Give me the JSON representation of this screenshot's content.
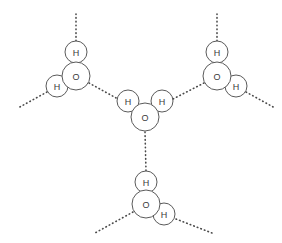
{
  "figure": {
    "background_color": "#ffffff",
    "stroke_color": "#5a5a5a",
    "label_color": "#3a3a3a",
    "bond_color": "#4a4a4a",
    "width": 282,
    "height": 243
  },
  "labels": {
    "oxygen": "O",
    "hydrogen": "H"
  },
  "molecules": [
    {
      "id": "molecule-top-left",
      "name": "water-molecule-top-left",
      "atoms": [
        {
          "id": "tl-O",
          "element": "O",
          "label": "O",
          "cx": 76,
          "cy": 76,
          "r": 14
        },
        {
          "id": "tl-H1",
          "element": "H",
          "label": "H",
          "cx": 76,
          "cy": 52,
          "r": 11
        },
        {
          "id": "tl-H2",
          "element": "H",
          "label": "H",
          "cx": 57,
          "cy": 86,
          "r": 11
        }
      ]
    },
    {
      "id": "molecule-top-right",
      "name": "water-molecule-top-right",
      "atoms": [
        {
          "id": "tr-O",
          "element": "O",
          "label": "O",
          "cx": 217,
          "cy": 76,
          "r": 14
        },
        {
          "id": "tr-H1",
          "element": "H",
          "label": "H",
          "cx": 217,
          "cy": 52,
          "r": 11
        },
        {
          "id": "tr-H2",
          "element": "H",
          "label": "H",
          "cx": 236,
          "cy": 86,
          "r": 11
        }
      ]
    },
    {
      "id": "molecule-center",
      "name": "water-molecule-center",
      "atoms": [
        {
          "id": "c-O",
          "element": "O",
          "label": "O",
          "cx": 145,
          "cy": 117,
          "r": 14
        },
        {
          "id": "c-H1",
          "element": "H",
          "label": "H",
          "cx": 128,
          "cy": 101,
          "r": 11
        },
        {
          "id": "c-H2",
          "element": "H",
          "label": "H",
          "cx": 162,
          "cy": 101,
          "r": 11
        }
      ]
    },
    {
      "id": "molecule-bottom",
      "name": "water-molecule-bottom",
      "atoms": [
        {
          "id": "b-O",
          "element": "O",
          "label": "O",
          "cx": 146,
          "cy": 204,
          "r": 14
        },
        {
          "id": "b-H1",
          "element": "H",
          "label": "H",
          "cx": 146,
          "cy": 182,
          "r": 11
        },
        {
          "id": "b-H2",
          "element": "H",
          "label": "H",
          "cx": 164,
          "cy": 214,
          "r": 11
        }
      ]
    }
  ],
  "hydrogen_bonds": [
    {
      "id": "hb-tl-up",
      "name": "hbond-top-left-upward",
      "x1": 76,
      "y1": 41,
      "x2": 76,
      "y2": 14
    },
    {
      "id": "hb-tl-left",
      "name": "hbond-top-left-outward-left",
      "x1": 47,
      "y1": 92,
      "x2": 18,
      "y2": 108
    },
    {
      "id": "hb-tl-center",
      "name": "hbond-top-left-to-center",
      "x1": 89,
      "y1": 83,
      "x2": 118,
      "y2": 99
    },
    {
      "id": "hb-tr-up",
      "name": "hbond-top-right-upward",
      "x1": 217,
      "y1": 41,
      "x2": 217,
      "y2": 14
    },
    {
      "id": "hb-tr-right",
      "name": "hbond-top-right-outward-right",
      "x1": 246,
      "y1": 92,
      "x2": 275,
      "y2": 108
    },
    {
      "id": "hb-tr-center",
      "name": "hbond-top-right-to-center",
      "x1": 204,
      "y1": 83,
      "x2": 173,
      "y2": 99
    },
    {
      "id": "hb-center-bottom",
      "name": "hbond-center-to-bottom",
      "x1": 145,
      "y1": 132,
      "x2": 146,
      "y2": 171
    },
    {
      "id": "hb-b-left",
      "name": "hbond-bottom-outward-left",
      "x1": 133,
      "y1": 212,
      "x2": 95,
      "y2": 233
    },
    {
      "id": "hb-b-right",
      "name": "hbond-bottom-outward-right",
      "x1": 176,
      "y1": 219,
      "x2": 212,
      "y2": 233
    }
  ]
}
